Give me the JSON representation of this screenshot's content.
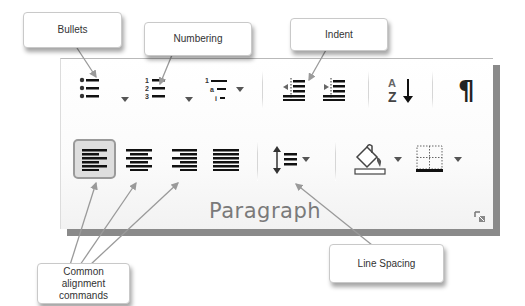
{
  "group": {
    "title": "Paragraph",
    "row1": [
      {
        "name": "bullets",
        "icon": "bullets-icon",
        "has_dropdown": true
      },
      {
        "name": "numbering",
        "icon": "numbering-icon",
        "has_dropdown": true
      },
      {
        "name": "multilevel-list",
        "icon": "multilevel-list-icon",
        "has_dropdown": true
      },
      {
        "name": "decrease-indent",
        "icon": "decrease-indent-icon",
        "has_dropdown": false
      },
      {
        "name": "increase-indent",
        "icon": "increase-indent-icon",
        "has_dropdown": false
      },
      {
        "name": "sort",
        "icon": "sort-az-icon",
        "glyph_top": "A",
        "glyph_bottom": "Z",
        "has_dropdown": false
      },
      {
        "name": "show-hide-formatting",
        "icon": "pilcrow-icon",
        "glyph": "¶",
        "has_dropdown": false
      }
    ],
    "row2": [
      {
        "name": "align-left",
        "icon": "align-left-icon",
        "selected": true
      },
      {
        "name": "align-center",
        "icon": "align-center-icon",
        "selected": false
      },
      {
        "name": "align-right",
        "icon": "align-right-icon",
        "selected": false
      },
      {
        "name": "justify",
        "icon": "justify-icon",
        "selected": false
      },
      {
        "name": "line-spacing",
        "icon": "line-spacing-icon",
        "has_dropdown": true
      },
      {
        "name": "shading",
        "icon": "paint-bucket-icon",
        "has_dropdown": true
      },
      {
        "name": "borders",
        "icon": "borders-icon",
        "has_dropdown": true
      }
    ],
    "dialog_launcher": "dialog-launcher-icon"
  },
  "callouts": {
    "bullets": "Bullets",
    "numbering": "Numbering",
    "indent": "Indent",
    "alignment_line1": "Common",
    "alignment_line2": "alignment",
    "alignment_line3": "commands",
    "line_spacing": "Line Spacing"
  },
  "colors": {
    "icon": "#222222",
    "label": "#7a7a7a",
    "panel_shadow": "#8a8a8a",
    "arrow": "#9a9a9a"
  }
}
